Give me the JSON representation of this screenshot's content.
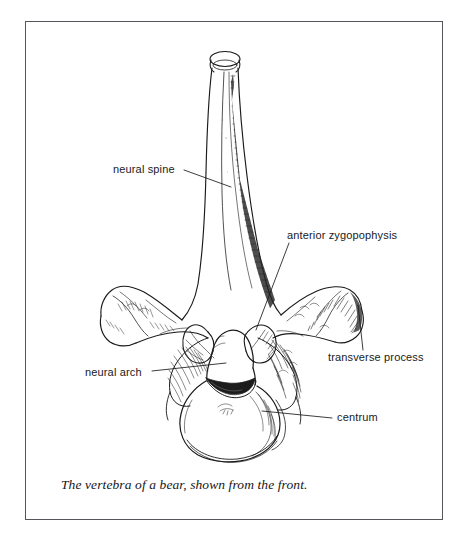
{
  "figure": {
    "caption": "The vertebra of a bear, shown from the front.",
    "border_color": "#55555c",
    "background_color": "#ffffff",
    "ink_color": "#1a1a1a",
    "labels": [
      {
        "id": "neural-spine",
        "text": "neural spine"
      },
      {
        "id": "anterior-zygopophysis",
        "text": "anterior zygopophysis"
      },
      {
        "id": "transverse-process",
        "text": "transverse process"
      },
      {
        "id": "neural-arch",
        "text": "neural arch"
      },
      {
        "id": "centrum",
        "text": "centrum"
      }
    ]
  }
}
